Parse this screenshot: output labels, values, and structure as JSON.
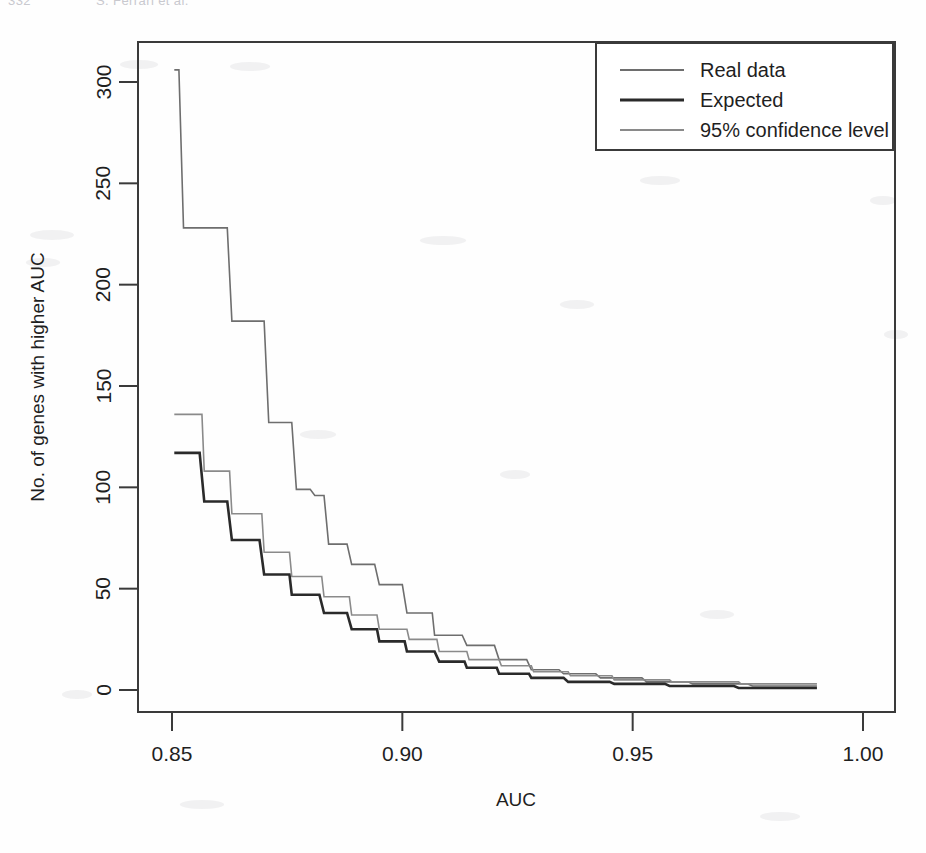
{
  "page": {
    "folio": "332",
    "running_head": "S. Ferrari et al."
  },
  "chart_data": {
    "type": "line",
    "subtype": "step",
    "title": "",
    "xlabel": "AUC",
    "ylabel": "No. of genes with higher AUC",
    "xlim": [
      0.845,
      1.0
    ],
    "ylim": [
      0,
      312
    ],
    "xticks": [
      0.85,
      0.9,
      0.95,
      1.0
    ],
    "xtick_labels": [
      "0.85",
      "0.90",
      "0.95",
      "1.00"
    ],
    "yticks": [
      0,
      50,
      100,
      150,
      200,
      250,
      300
    ],
    "ytick_labels": [
      "0",
      "50",
      "100",
      "150",
      "200",
      "250",
      "300"
    ],
    "grid": false,
    "legend_position": "top-right",
    "series": [
      {
        "name": "Real data",
        "color": "#6e6e6e",
        "line_width": 1.6,
        "points": [
          [
            0.8505,
            306
          ],
          [
            0.8515,
            306
          ],
          [
            0.8525,
            228
          ],
          [
            0.862,
            228
          ],
          [
            0.863,
            182
          ],
          [
            0.87,
            182
          ],
          [
            0.871,
            132
          ],
          [
            0.876,
            132
          ],
          [
            0.877,
            99
          ],
          [
            0.88,
            99
          ],
          [
            0.881,
            96
          ],
          [
            0.883,
            96
          ],
          [
            0.884,
            72
          ],
          [
            0.888,
            72
          ],
          [
            0.889,
            62
          ],
          [
            0.894,
            62
          ],
          [
            0.895,
            52
          ],
          [
            0.9,
            52
          ],
          [
            0.901,
            38
          ],
          [
            0.9065,
            38
          ],
          [
            0.907,
            27
          ],
          [
            0.913,
            27
          ],
          [
            0.914,
            22
          ],
          [
            0.92,
            22
          ],
          [
            0.921,
            15
          ],
          [
            0.927,
            15
          ],
          [
            0.928,
            10
          ],
          [
            0.934,
            10
          ],
          [
            0.935,
            8
          ],
          [
            0.942,
            8
          ],
          [
            0.943,
            6
          ],
          [
            0.952,
            6
          ],
          [
            0.953,
            4
          ],
          [
            0.962,
            4
          ],
          [
            0.963,
            3
          ],
          [
            0.975,
            3
          ],
          [
            0.976,
            2
          ],
          [
            0.99,
            2
          ]
        ]
      },
      {
        "name": "Expected",
        "color": "#2a2a2a",
        "line_width": 2.6,
        "points": [
          [
            0.8505,
            117
          ],
          [
            0.856,
            117
          ],
          [
            0.857,
            93
          ],
          [
            0.862,
            93
          ],
          [
            0.863,
            74
          ],
          [
            0.869,
            74
          ],
          [
            0.87,
            57
          ],
          [
            0.8755,
            57
          ],
          [
            0.876,
            47
          ],
          [
            0.882,
            47
          ],
          [
            0.883,
            38
          ],
          [
            0.888,
            38
          ],
          [
            0.889,
            30
          ],
          [
            0.8945,
            30
          ],
          [
            0.895,
            24
          ],
          [
            0.9005,
            24
          ],
          [
            0.901,
            19
          ],
          [
            0.907,
            19
          ],
          [
            0.908,
            14
          ],
          [
            0.9135,
            14
          ],
          [
            0.914,
            11
          ],
          [
            0.9205,
            11
          ],
          [
            0.921,
            8
          ],
          [
            0.9275,
            8
          ],
          [
            0.928,
            6
          ],
          [
            0.935,
            6
          ],
          [
            0.936,
            4
          ],
          [
            0.945,
            4
          ],
          [
            0.946,
            3
          ],
          [
            0.957,
            3
          ],
          [
            0.958,
            2
          ],
          [
            0.972,
            2
          ],
          [
            0.973,
            1
          ],
          [
            0.99,
            1
          ]
        ]
      },
      {
        "name": "95% confidence level",
        "color": "#8a8a8a",
        "line_width": 1.6,
        "points": [
          [
            0.8505,
            136
          ],
          [
            0.8565,
            136
          ],
          [
            0.857,
            108
          ],
          [
            0.8625,
            108
          ],
          [
            0.863,
            87
          ],
          [
            0.8695,
            87
          ],
          [
            0.87,
            68
          ],
          [
            0.8755,
            68
          ],
          [
            0.876,
            56
          ],
          [
            0.8825,
            56
          ],
          [
            0.883,
            46
          ],
          [
            0.8885,
            46
          ],
          [
            0.889,
            37
          ],
          [
            0.8945,
            37
          ],
          [
            0.895,
            30
          ],
          [
            0.901,
            30
          ],
          [
            0.9015,
            25
          ],
          [
            0.9075,
            25
          ],
          [
            0.908,
            19
          ],
          [
            0.914,
            19
          ],
          [
            0.9145,
            15
          ],
          [
            0.921,
            15
          ],
          [
            0.9215,
            12
          ],
          [
            0.928,
            12
          ],
          [
            0.9285,
            9
          ],
          [
            0.936,
            9
          ],
          [
            0.9365,
            7
          ],
          [
            0.9455,
            7
          ],
          [
            0.946,
            5
          ],
          [
            0.958,
            5
          ],
          [
            0.9585,
            4
          ],
          [
            0.973,
            4
          ],
          [
            0.9735,
            3
          ],
          [
            0.99,
            3
          ]
        ]
      }
    ]
  }
}
